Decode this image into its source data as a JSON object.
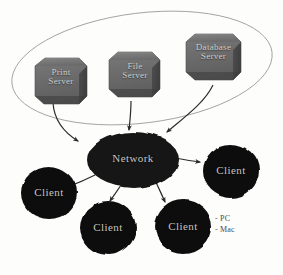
{
  "diagram": {
    "background_color": "#fdfdfc",
    "server_group": {
      "name": "server-group-ellipse",
      "stroke_color": "#9a9a96",
      "servers": [
        {
          "id": "print-server",
          "line1": "Print",
          "line2": "Server",
          "fill": "#6e6e6e"
        },
        {
          "id": "file-server",
          "line1": "File",
          "line2": "Server",
          "fill": "#6e6e6e"
        },
        {
          "id": "database-server",
          "line1": "Database",
          "line2": "Server",
          "fill": "#6e6e6e"
        }
      ]
    },
    "network": {
      "id": "network-cloud",
      "label": "Network",
      "fill": "#141414"
    },
    "clients": [
      {
        "id": "client-left",
        "label": "Client",
        "fill": "#0f0f0f"
      },
      {
        "id": "client-right",
        "label": "Client",
        "fill": "#0f0f0f"
      },
      {
        "id": "client-bottom-left",
        "label": "Client",
        "fill": "#0f0f0f"
      },
      {
        "id": "client-bottom-right",
        "label": "Client",
        "fill": "#0f0f0f"
      }
    ],
    "legend": {
      "items": [
        {
          "dash": "-",
          "label": "PC"
        },
        {
          "dash": "-",
          "label": "Mac"
        }
      ]
    },
    "connector_color": "#2b2b2b"
  }
}
